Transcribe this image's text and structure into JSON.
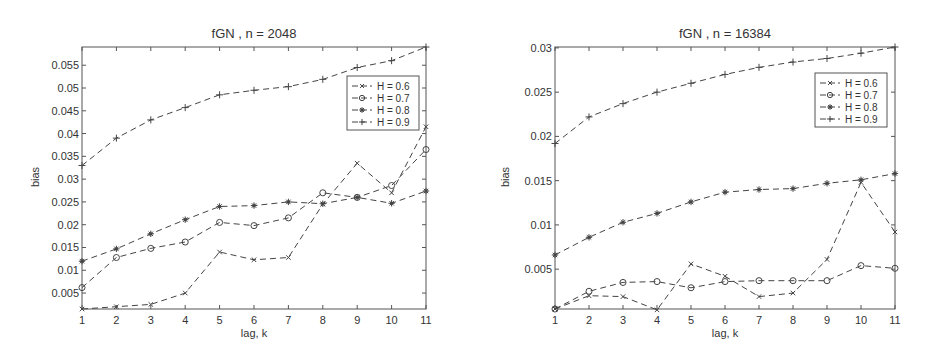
{
  "chart_data": [
    {
      "type": "line",
      "title": "fGN , n = 2048",
      "xlabel": "lag, k",
      "ylabel": "bias",
      "x": [
        1,
        2,
        3,
        4,
        5,
        6,
        7,
        8,
        9,
        10,
        11
      ],
      "xticks": [
        1,
        2,
        3,
        4,
        5,
        6,
        7,
        8,
        9,
        10,
        11
      ],
      "yticks": [
        0.005,
        0.01,
        0.015,
        0.02,
        0.025,
        0.03,
        0.035,
        0.04,
        0.045,
        0.05,
        0.055
      ],
      "ytick_labels": [
        "0.005",
        "0.01",
        "0.015",
        "0.02",
        "0.025",
        "0.03",
        "0.035",
        "0.04",
        "0.045",
        "0.05",
        "0.055"
      ],
      "xlim": [
        1,
        11
      ],
      "ylim": [
        0.0015,
        0.059
      ],
      "grid": false,
      "legend_position": "upper right",
      "series": [
        {
          "name": "H = 0.6",
          "marker": "x",
          "values": [
            0.0015,
            0.002,
            0.0025,
            0.005,
            0.014,
            0.0123,
            0.0128,
            0.0245,
            0.0335,
            0.027,
            0.0415
          ]
        },
        {
          "name": "H = 0.7",
          "marker": "o",
          "values": [
            0.0062,
            0.0128,
            0.0148,
            0.0162,
            0.0205,
            0.0198,
            0.0215,
            0.027,
            0.026,
            0.0286,
            0.0365
          ]
        },
        {
          "name": "H = 0.8",
          "marker": "*",
          "values": [
            0.012,
            0.0147,
            0.018,
            0.0211,
            0.024,
            0.0242,
            0.025,
            0.0246,
            0.026,
            0.0247,
            0.0274
          ]
        },
        {
          "name": "H = 0.9",
          "marker": "+",
          "values": [
            0.033,
            0.039,
            0.043,
            0.0457,
            0.0485,
            0.0495,
            0.0503,
            0.0519,
            0.0545,
            0.056,
            0.059
          ]
        }
      ]
    },
    {
      "type": "line",
      "title": "fGN , n = 16384",
      "xlabel": "lag, k",
      "ylabel": "bias",
      "x": [
        1,
        2,
        3,
        4,
        5,
        6,
        7,
        8,
        9,
        10,
        11
      ],
      "xticks": [
        1,
        2,
        3,
        4,
        5,
        6,
        7,
        8,
        9,
        10,
        11
      ],
      "yticks": [
        0.005,
        0.01,
        0.015,
        0.02,
        0.025,
        0.03
      ],
      "ytick_labels": [
        "0.005",
        "0.01",
        "0.015",
        "0.02",
        "0.025",
        "0.03"
      ],
      "xlim": [
        1,
        11
      ],
      "ylim": [
        0.0005,
        0.0301
      ],
      "grid": false,
      "legend_position": "upper right",
      "series": [
        {
          "name": "H = 0.6",
          "marker": "x",
          "values": [
            0.0005,
            0.002,
            0.0019,
            0.0004,
            0.0056,
            0.0042,
            0.0019,
            0.0023,
            0.0061,
            0.0148,
            0.0092
          ]
        },
        {
          "name": "H = 0.7",
          "marker": "o",
          "values": [
            0.0005,
            0.0025,
            0.0035,
            0.0036,
            0.0029,
            0.0036,
            0.0037,
            0.0037,
            0.0037,
            0.0054,
            0.0051
          ]
        },
        {
          "name": "H = 0.8",
          "marker": "*",
          "values": [
            0.0066,
            0.0086,
            0.0103,
            0.0113,
            0.0126,
            0.0137,
            0.014,
            0.0141,
            0.0147,
            0.0151,
            0.0158
          ]
        },
        {
          "name": "H = 0.9",
          "marker": "+",
          "values": [
            0.0192,
            0.0222,
            0.0237,
            0.025,
            0.026,
            0.027,
            0.0278,
            0.0284,
            0.0288,
            0.0294,
            0.0301
          ]
        }
      ]
    }
  ],
  "plots": [
    {
      "title": "fGN , n = 2048",
      "xlabel": "lag, k",
      "ylabel": "bias"
    },
    {
      "title": "fGN , n = 16384",
      "xlabel": "lag, k",
      "ylabel": "bias"
    }
  ]
}
